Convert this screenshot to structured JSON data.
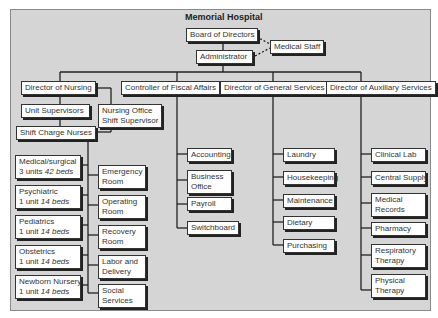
{
  "title": "Memorial Hospital",
  "top": {
    "board": "Board of Directors",
    "medical_staff": "Medical Staff",
    "administrator": "Administrator"
  },
  "directors": {
    "nursing": "Director of Nursing",
    "fiscal": "Controller of Fiscal Affairs",
    "general": "Director of General Services",
    "auxiliary": "Director of Auxiliary Services"
  },
  "nursing": {
    "unit_supervisors": "Unit Supervisors",
    "office_supervisor_1": "Nursing Office",
    "office_supervisor_2": "Shift Supervisor",
    "shift_charge": "Shift Charge Nurses",
    "units": [
      {
        "name": "Medical/surgical",
        "count": "3 units",
        "beds": "42 beds"
      },
      {
        "name": "Psychiatric",
        "count": "1 unit",
        "beds": "14 beds"
      },
      {
        "name": "Pediatrics",
        "count": "1 unit",
        "beds": "14 beds"
      },
      {
        "name": "Obstetrics",
        "count": "1 unit",
        "beds": "14 beds"
      },
      {
        "name": "Newborn Nursery",
        "count": "1 unit",
        "beds": "14 beds"
      }
    ],
    "services": [
      {
        "l1": "Emergency",
        "l2": "Room"
      },
      {
        "l1": "Operating",
        "l2": "Room"
      },
      {
        "l1": "Recovery",
        "l2": "Room"
      },
      {
        "l1": "Labor and",
        "l2": "Delivery"
      },
      {
        "l1": "Social",
        "l2": "Services"
      }
    ]
  },
  "fiscal": [
    {
      "l1": "Accounting",
      "l2": ""
    },
    {
      "l1": "Business",
      "l2": "Office"
    },
    {
      "l1": "Payroll",
      "l2": ""
    },
    {
      "l1": "Switchboard",
      "l2": ""
    }
  ],
  "general": [
    {
      "l1": "Laundry"
    },
    {
      "l1": "Housekeeping"
    },
    {
      "l1": "Maintenance"
    },
    {
      "l1": "Dietary"
    },
    {
      "l1": "Purchasing"
    }
  ],
  "auxiliary": [
    {
      "l1": "Clinical Lab",
      "l2": ""
    },
    {
      "l1": "Central Supply",
      "l2": ""
    },
    {
      "l1": "Medical",
      "l2": "Records"
    },
    {
      "l1": "Pharmacy",
      "l2": ""
    },
    {
      "l1": "Respiratory",
      "l2": "Therapy"
    },
    {
      "l1": "Physical",
      "l2": "Therapy"
    }
  ]
}
